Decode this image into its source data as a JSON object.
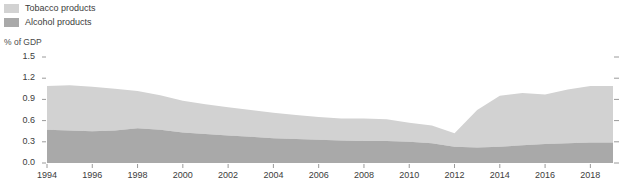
{
  "legend": {
    "items": [
      {
        "label": "Tobacco products",
        "color": "#d2d2d2",
        "icon": "legend-swatch"
      },
      {
        "label": "Alcohol products",
        "color": "#a9a9a9",
        "icon": "legend-swatch"
      }
    ]
  },
  "axis": {
    "y_title": "% of GDP"
  },
  "chart_data": {
    "type": "area",
    "stacked": true,
    "title": "",
    "subtitle": "",
    "xlabel": "",
    "ylabel": "% of GDP",
    "ylim": [
      0.0,
      1.5
    ],
    "xlim": [
      1994,
      2019
    ],
    "grid": false,
    "legend_position": "top-left",
    "ytick_labels": [
      "0.0",
      "0.3",
      "0.6",
      "0.9",
      "1.2",
      "1.5"
    ],
    "ytick_values": [
      0.0,
      0.3,
      0.6,
      0.9,
      1.2,
      1.5
    ],
    "xtick_labels": [
      "1994",
      "1996",
      "1998",
      "2000",
      "2002",
      "2004",
      "2006",
      "2008",
      "2010",
      "2012",
      "2014",
      "2016",
      "2018"
    ],
    "xtick_values": [
      1994,
      1996,
      1998,
      2000,
      2002,
      2004,
      2006,
      2008,
      2010,
      2012,
      2014,
      2016,
      2018
    ],
    "x": [
      1994,
      1995,
      1996,
      1997,
      1998,
      1999,
      2000,
      2001,
      2002,
      2003,
      2004,
      2005,
      2006,
      2007,
      2008,
      2009,
      2010,
      2011,
      2012,
      2013,
      2014,
      2015,
      2016,
      2017,
      2018,
      2019
    ],
    "series": [
      {
        "name": "Alcohol products",
        "color": "#a9a9a9",
        "values": [
          0.47,
          0.46,
          0.45,
          0.46,
          0.49,
          0.47,
          0.43,
          0.41,
          0.39,
          0.37,
          0.35,
          0.34,
          0.33,
          0.32,
          0.31,
          0.31,
          0.3,
          0.28,
          0.23,
          0.22,
          0.23,
          0.25,
          0.27,
          0.28,
          0.29,
          0.29
        ]
      },
      {
        "name": "Tobacco products",
        "color": "#d2d2d2",
        "values": [
          0.62,
          0.64,
          0.63,
          0.59,
          0.53,
          0.49,
          0.45,
          0.42,
          0.4,
          0.38,
          0.36,
          0.34,
          0.32,
          0.31,
          0.32,
          0.31,
          0.27,
          0.25,
          0.19,
          0.53,
          0.72,
          0.74,
          0.7,
          0.76,
          0.8,
          0.8
        ]
      }
    ],
    "totals": [
      1.09,
      1.1,
      1.08,
      1.05,
      1.02,
      0.96,
      0.88,
      0.83,
      0.79,
      0.75,
      0.71,
      0.68,
      0.65,
      0.63,
      0.63,
      0.62,
      0.57,
      0.53,
      0.42,
      0.75,
      0.95,
      0.99,
      0.97,
      1.04,
      1.09,
      1.09
    ]
  }
}
